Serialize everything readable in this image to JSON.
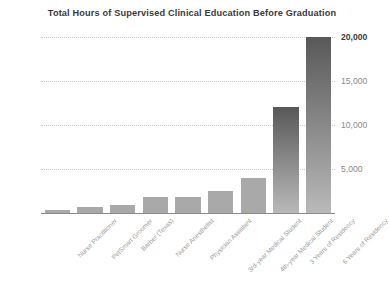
{
  "chart_data": {
    "type": "bar",
    "title": "Total Hours of Supervised Clinical Education Before Graduation",
    "xlabel": "",
    "ylabel": "",
    "ylim": [
      0,
      20000
    ],
    "grid": true,
    "legend": "none",
    "categories": [
      "Nurse Practitioner",
      "PetSmart Groomer",
      "Barber (Texas)",
      "Nurse Anesthetist",
      "Physician Assistant",
      "3rd-year Medical Student",
      "4th-year Medical Student",
      "3 Years of Residency",
      "6 Years of Residency"
    ],
    "values": [
      300,
      700,
      900,
      1800,
      1800,
      2500,
      4000,
      12000,
      20000
    ],
    "yticks": [
      5000,
      10000,
      15000,
      20000
    ],
    "ytick_labels": [
      "5,000",
      "10,000",
      "15,000",
      "20,000"
    ],
    "ytick_emphasis": [
      false,
      false,
      false,
      true
    ],
    "bar_colors": {
      "flat": "#a9a9a9",
      "gradient_top": "#585858",
      "gradient_bottom": "#b9b9b9"
    },
    "colors": {
      "title": "#3b3b3b",
      "gridline": "#c9c9c9",
      "axis": "#8c8c8c",
      "tick_label": "#9a9a9a",
      "tick_label_emphasis": "#3b3b3b",
      "background": "#ffffff"
    }
  }
}
